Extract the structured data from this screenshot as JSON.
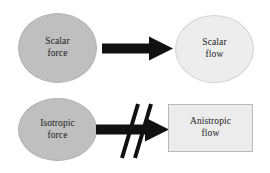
{
  "diagram": {
    "background_color": "#ffffff",
    "text_color": "#1a1a1a",
    "arrow_color": "#111111",
    "source_fill": "#bfbfbf",
    "target_fill": "#ededed",
    "rows": [
      {
        "id": "row-scalar",
        "source": {
          "shape": "ellipse",
          "line1": "Scalar",
          "line2": "force",
          "fill": "#bfbfbf"
        },
        "arrow": {
          "kind": "arrow-right",
          "blocked": false
        },
        "target": {
          "shape": "ellipse",
          "line1": "Scalar",
          "line2": "flow",
          "fill": "#ededed"
        }
      },
      {
        "id": "row-isotropic",
        "source": {
          "shape": "ellipse",
          "line1": "Isotropic",
          "line2": "force",
          "fill": "#bfbfbf"
        },
        "arrow": {
          "kind": "arrow-right-blocked",
          "blocked": true,
          "slash_count": 2
        },
        "target": {
          "shape": "rectangle",
          "line1": "Anistropic",
          "line2": "flow",
          "fill": "#ececec"
        }
      }
    ]
  }
}
